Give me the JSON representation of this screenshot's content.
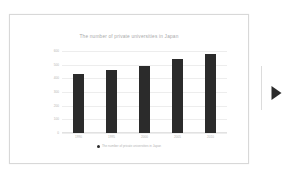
{
  "slide": {
    "name": "presentation-slide"
  },
  "nav": {
    "next_icon": "play-triangle-icon",
    "next_label": "Next slide"
  },
  "chart_data": {
    "type": "bar",
    "title": "The number of private universities in Japan",
    "xlabel": "",
    "ylabel": "",
    "categories": [
      "1990",
      "1995",
      "2000",
      "2005",
      "2010"
    ],
    "values": [
      430,
      460,
      490,
      540,
      580
    ],
    "ylim": [
      0,
      600
    ],
    "yticks": [
      0,
      100,
      200,
      300,
      400,
      500,
      600
    ],
    "ytick_labels": [
      "0",
      "100",
      "200",
      "300",
      "400",
      "500",
      "600"
    ],
    "grid": true,
    "legend_position": "bottom",
    "legend": [
      {
        "name": "The number of private universities in Japan",
        "color": "#2b2b2b",
        "marker": "circle"
      }
    ],
    "series": [
      {
        "name": "The number of private universities in Japan",
        "color": "#2b2b2b",
        "values": [
          430,
          460,
          490,
          540,
          580
        ]
      }
    ]
  },
  "colors": {
    "bar": "#2b2b2b",
    "gridline": "#ededed",
    "axis_text": "#b4b4b4",
    "title_text": "#a9a9a9",
    "slide_border": "#d8d8d8",
    "page_background": "#ffffff"
  }
}
